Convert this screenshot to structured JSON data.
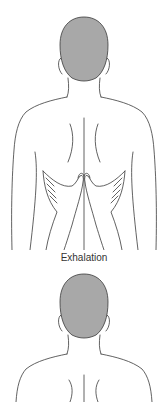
{
  "figure": {
    "caption": "Exhalation",
    "panels": [
      {
        "id": "top",
        "description": "back view of torso with two hands placed on lower ribs, thumbs meeting at spine"
      },
      {
        "id": "bottom",
        "description": "back view of head and upper shoulders"
      }
    ]
  },
  "colors": {
    "line": "#3a3a3a",
    "hair": "#a8a8a8",
    "background": "#ffffff"
  }
}
